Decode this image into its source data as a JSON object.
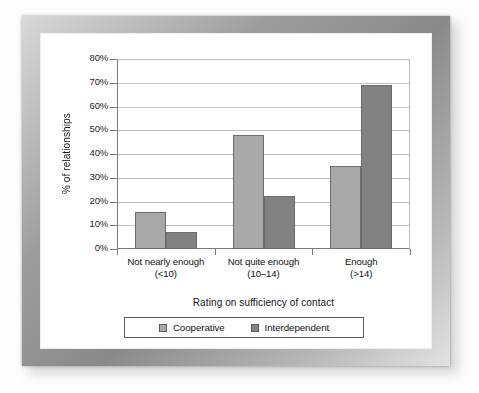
{
  "chart_data": {
    "type": "bar",
    "title": "",
    "subtitle": "",
    "xlabel": "Rating on sufficiency of contact",
    "ylabel": "% of relationships",
    "categories": [
      "Not nearly enough\n(<10)",
      "Not quite enough\n(10–14)",
      "Enough\n(>14)"
    ],
    "category_lines": [
      {
        "line1": "Not nearly enough",
        "line2": "(<10)"
      },
      {
        "line1": "Not quite enough",
        "line2": "(10–14)"
      },
      {
        "line1": "Enough",
        "line2": "(>14)"
      }
    ],
    "series": [
      {
        "name": "Cooperative",
        "color": "#a9a9a9",
        "values": [
          15.5,
          48,
          35
        ]
      },
      {
        "name": "Interdependent",
        "color": "#818181",
        "values": [
          7,
          22.5,
          69
        ]
      }
    ],
    "ylim": [
      0,
      80
    ],
    "ytick_step": 10,
    "ytick_labels": [
      "0%",
      "10%",
      "20%",
      "30%",
      "40%",
      "50%",
      "60%",
      "70%",
      "80%"
    ],
    "ytick_values": [
      0,
      10,
      20,
      30,
      40,
      50,
      60,
      70,
      80
    ],
    "grid": true,
    "grid_axis": "y",
    "legend_position": "bottom",
    "bar_border_color": "#6c6c6c",
    "axis_color": "#7a7a7a",
    "gridline_color": "#c2c2c2",
    "plot_background": "#ffffff"
  },
  "figure": {
    "frame_color": "#9d9d9d",
    "panel_color": "#ffffff",
    "page_background": "#fdfdfd"
  },
  "legend": {
    "items": [
      {
        "label": "Cooperative",
        "color": "#a9a9a9"
      },
      {
        "label": "Interdependent",
        "color": "#818181"
      }
    ]
  }
}
